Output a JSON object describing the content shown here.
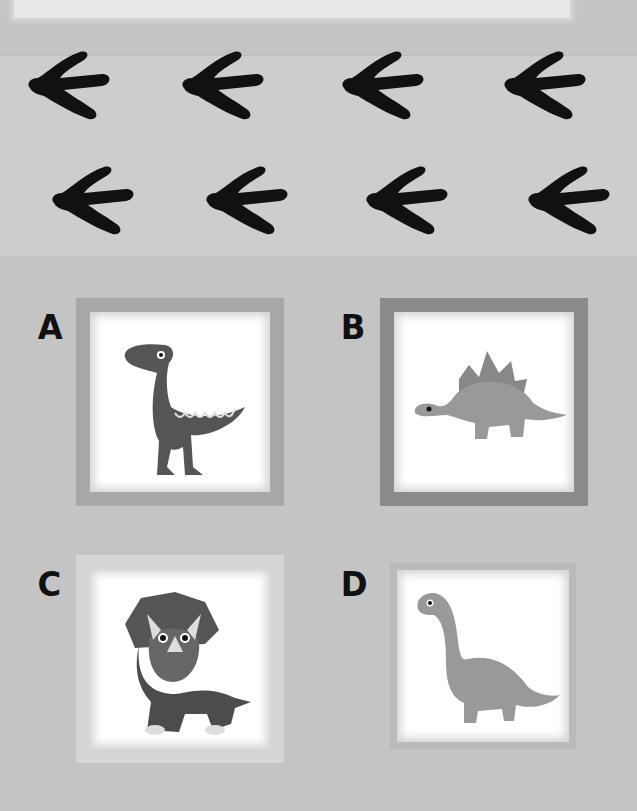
{
  "page": {
    "background_color": "#c4c4c4",
    "track_color": "#111111"
  },
  "footprints": {
    "icon": "dinosaur-footprint-icon",
    "count": 8,
    "rows": [
      {
        "row": 1,
        "items": 4
      },
      {
        "row": 2,
        "items": 4
      }
    ]
  },
  "options": [
    {
      "letter": "A",
      "dinosaur": "raptor",
      "icon": "raptor-icon",
      "frame_color": "#a8a8a8"
    },
    {
      "letter": "B",
      "dinosaur": "stegosaurus",
      "icon": "stegosaurus-icon",
      "frame_color": "#8a8a8a"
    },
    {
      "letter": "C",
      "dinosaur": "triceratops",
      "icon": "triceratops-icon",
      "frame_color": "#d6d6d6"
    },
    {
      "letter": "D",
      "dinosaur": "brachiosaurus",
      "icon": "brachiosaurus-icon",
      "frame_color": "#bababa"
    }
  ]
}
